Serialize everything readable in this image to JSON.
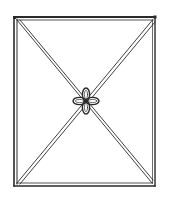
{
  "figure": {
    "stroke_color": "#2a2a2a",
    "background": "#ffffff",
    "frame": {
      "x": 14,
      "y": 17,
      "width": 141,
      "height": 169
    },
    "knot_center": {
      "x": 86,
      "y": 101
    }
  }
}
